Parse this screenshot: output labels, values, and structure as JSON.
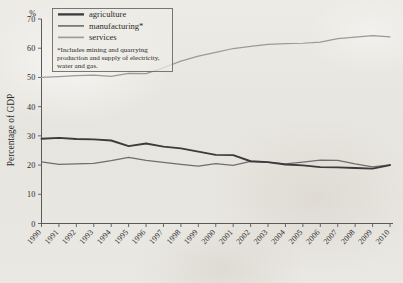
{
  "chart_data": {
    "type": "line",
    "title": "",
    "xlabel": "",
    "ylabel": "Percentage of GDP",
    "unit_label": "%",
    "xlim": [
      1990,
      2010
    ],
    "ylim": [
      0,
      70
    ],
    "ytick_labels": [
      "0",
      "10",
      "20",
      "30",
      "40",
      "50",
      "60",
      "70"
    ],
    "ytick_values": [
      0,
      10,
      20,
      30,
      40,
      50,
      60,
      70
    ],
    "grid": false,
    "legend_position": "top-left",
    "x": [
      1990,
      1991,
      1992,
      1993,
      1994,
      1995,
      1996,
      1997,
      1998,
      1999,
      2000,
      2001,
      2002,
      2003,
      2004,
      2005,
      2006,
      2007,
      2008,
      2009,
      2010
    ],
    "categories": [
      "1990",
      "1991",
      "1992",
      "1993",
      "1994",
      "1995",
      "1996",
      "1997",
      "1998",
      "1999",
      "2000",
      "2001",
      "2002",
      "2003",
      "2004",
      "2005",
      "2006",
      "2007",
      "2008",
      "2009",
      "2010"
    ],
    "series": [
      {
        "name": "agriculture",
        "color": "#3b3b3b",
        "width": 1.9,
        "values": [
          29.0,
          29.3,
          28.9,
          28.8,
          28.4,
          26.5,
          27.4,
          26.3,
          25.7,
          24.6,
          23.5,
          23.4,
          21.3,
          21.0,
          20.2,
          19.9,
          19.3,
          19.2,
          19.0,
          18.8,
          20.0
        ]
      },
      {
        "name": "manufacturing*",
        "color": "#6e6e6e",
        "width": 1.25,
        "values": [
          21.1,
          20.2,
          20.4,
          20.6,
          21.5,
          22.6,
          21.6,
          20.9,
          20.2,
          19.6,
          20.5,
          19.9,
          21.3,
          20.9,
          20.4,
          21.0,
          21.7,
          21.6,
          20.4,
          19.4,
          20.1
        ]
      },
      {
        "name": "services",
        "color": "#9a9a98",
        "width": 1.25,
        "values": [
          50.0,
          50.3,
          50.6,
          50.8,
          50.4,
          51.4,
          51.3,
          53.3,
          55.6,
          57.3,
          58.6,
          59.9,
          60.6,
          61.3,
          61.6,
          61.7,
          62.1,
          63.3,
          63.8,
          64.3,
          63.9
        ]
      }
    ],
    "legend": [
      {
        "label": "agriculture"
      },
      {
        "label": "manufacturing*"
      },
      {
        "label": "services"
      }
    ],
    "footnote_lines": [
      "*Includes mining and quarrying",
      "production and supply of electricity,",
      "water and gas."
    ]
  }
}
